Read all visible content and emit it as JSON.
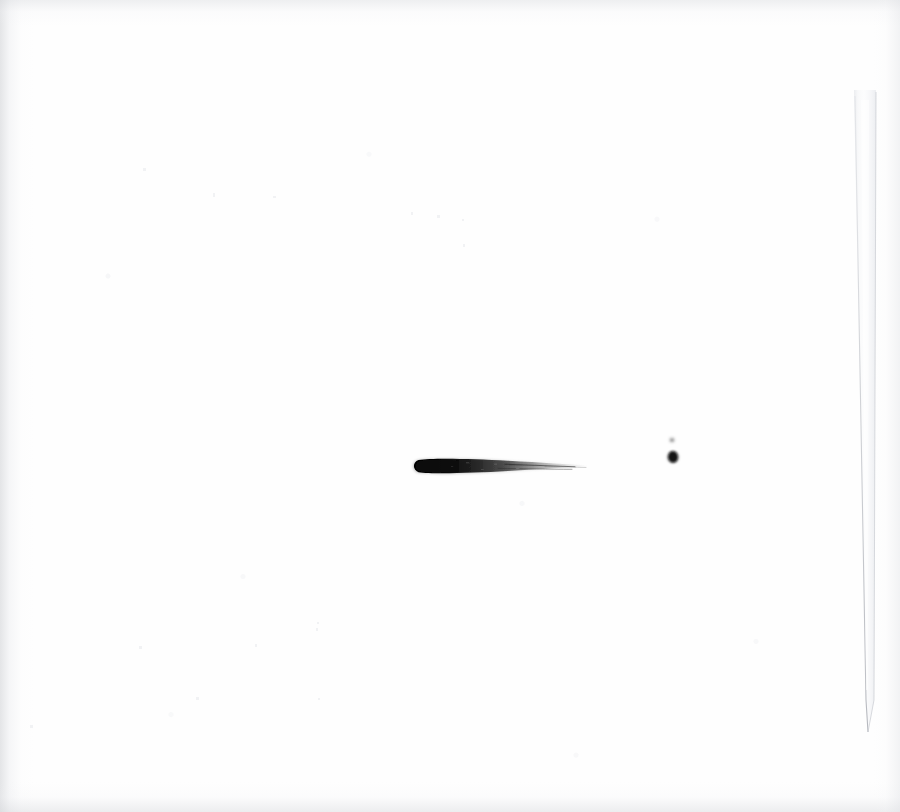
{
  "image": {
    "kind": "scanned-paper-artwork",
    "title": "Single tapering ink brush stroke on white paper",
    "width_px": 900,
    "height_px": 812,
    "background_color": "#ffffff",
    "paper_tone": "#fefefe",
    "capture_style": "flatbed scan, high key, soft edge vignette"
  },
  "palette": {
    "ink_core": "#0a0a0a",
    "ink_mid": "#2b2b2b",
    "ink_faint": "#8d8d8d",
    "paper_white": "#ffffff",
    "paper_shade": "#f2f3f5",
    "edge_grey": "#d6d8dc",
    "strip_grey": "#e8eaed",
    "strip_line": "#b9bcc2"
  },
  "marks": [
    {
      "id": "primary-stroke",
      "name": "tapering-ink-stroke",
      "description": "Horizontal brush stroke, blunt rounded head at left, thinning to a dry-brush wisp that fades out at right",
      "x_start_px": 417,
      "x_end_px": 589,
      "y_center_px": 466,
      "max_thickness_px": 13,
      "min_thickness_px": 1,
      "orientation": "horizontal",
      "head_side": "left",
      "tail_side": "right",
      "color": "#0a0a0a",
      "opacity_head": 1.0,
      "opacity_tail": 0.18
    },
    {
      "id": "ink-dot-large",
      "name": "ink-dot-large",
      "description": "Small solid round ink blot, slightly irregular",
      "cx_px": 673,
      "cy_px": 457,
      "radius_px": 5,
      "color": "#0d0d0d",
      "opacity": 0.96
    },
    {
      "id": "ink-dot-small",
      "name": "ink-dot-small",
      "description": "Very small faint speck above the larger blot",
      "cx_px": 672,
      "cy_px": 440,
      "radius_px": 2,
      "color": "#6f6f6f",
      "opacity": 0.5
    }
  ],
  "paper_strip": {
    "name": "right-edge-paper-strip",
    "description": "Faint pale vertical strip along the right side, slightly tilted, narrowing to a point near the bottom",
    "top_y_px": 90,
    "bottom_y_px": 732,
    "top_left_x_px": 854,
    "top_right_x_px": 876,
    "bottom_left_x_px": 866,
    "bottom_right_x_px": 874,
    "fill_color": "#eff1f3",
    "edge_color": "#b9bcc2",
    "opacity": 0.65
  },
  "dust_specks": {
    "name": "scanner-dust-specks",
    "count": 14,
    "color": "#f0f1f3",
    "description": "Barely visible grey specks scattered over the blank paper"
  }
}
